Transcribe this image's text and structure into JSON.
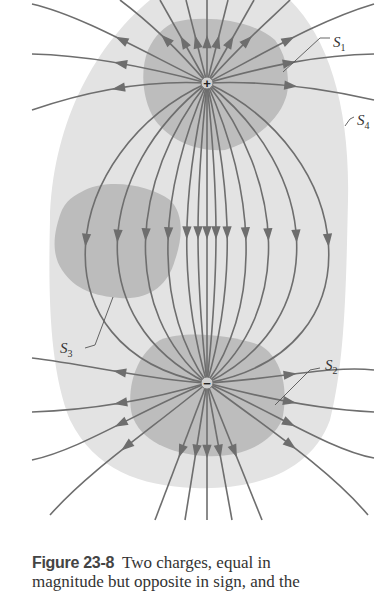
{
  "figure": {
    "labels": {
      "s1": "S",
      "s1_sub": "1",
      "s2": "S",
      "s2_sub": "2",
      "s3": "S",
      "s3_sub": "3",
      "s4": "S",
      "s4_sub": "4"
    },
    "charges": {
      "positive": "+",
      "negative": "−"
    },
    "colors": {
      "field_line": "#6e6e6e",
      "surface_inner": "#b9b9b9",
      "surface_outer": "#e2e2e2",
      "surface_s3": "#bdbdbd"
    }
  },
  "caption": {
    "label": "Figure 23-8",
    "line1": "Two charges, equal in",
    "line2": "magnitude but opposite in sign, and the"
  }
}
